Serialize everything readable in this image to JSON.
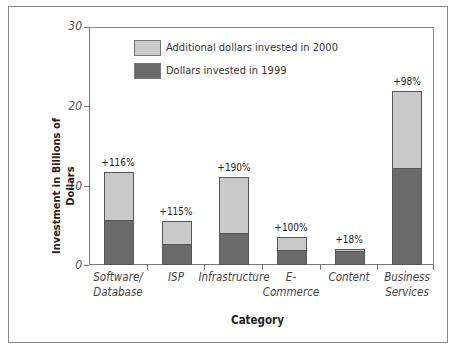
{
  "chart_data": {
    "type": "bar",
    "stacked": true,
    "title": "",
    "xlabel": "Category",
    "ylabel": "Investment in Billions of Dollars",
    "ylim": [
      0,
      30
    ],
    "yticks": [
      0,
      10,
      20,
      30
    ],
    "grid": false,
    "legend_position": "top-left inside plot",
    "categories": [
      "Software/ Database",
      "ISP",
      "Infrastructure",
      "E- Commerce",
      "Content",
      "Business Services"
    ],
    "series": [
      {
        "name": "Dollars invested in 1999",
        "color": "#6b6b6b",
        "values": [
          5.5,
          2.5,
          3.9,
          1.8,
          1.7,
          12.1
        ]
      },
      {
        "name": "Additional dollars invested in 2000",
        "color": "#c9c9c9",
        "values": [
          6.2,
          3.0,
          7.2,
          1.7,
          0.3,
          9.9
        ]
      }
    ],
    "totals": [
      11.7,
      5.5,
      11.1,
      3.5,
      2.0,
      22.0
    ],
    "annotations": [
      "+116%",
      "+115%",
      "+190%",
      "+100%",
      "+18%",
      "+98%"
    ]
  },
  "legend": {
    "add_label": "Additional dollars invested in 2000",
    "base_label": "Dollars invested in 1999"
  },
  "axes": {
    "y_title": "Investment in Billions of Dollars",
    "x_title": "Category",
    "y_ticks": [
      "0",
      "10",
      "20",
      "30"
    ],
    "x_labels": [
      [
        "Software/",
        "Database"
      ],
      [
        "ISP",
        ""
      ],
      [
        "Infrastructure",
        ""
      ],
      [
        "E-",
        "Commerce"
      ],
      [
        "Content",
        ""
      ],
      [
        "Business",
        "Services"
      ]
    ]
  }
}
